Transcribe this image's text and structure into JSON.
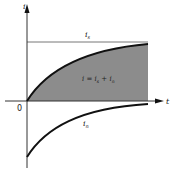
{
  "diagram": {
    "y_axis_label": "i",
    "x_axis_label": "t",
    "origin_label": "0",
    "steady_state_label": "i",
    "steady_state_sub": "s",
    "total_label": "i = i",
    "total_sub1": "s",
    "total_plus": " + i",
    "total_sub2": "n",
    "natural_label": "i",
    "natural_sub": "n",
    "colors": {
      "shade": "#8a8a8a",
      "curve": "#111111",
      "axis": "#333333",
      "steady_line": "#777777"
    }
  }
}
